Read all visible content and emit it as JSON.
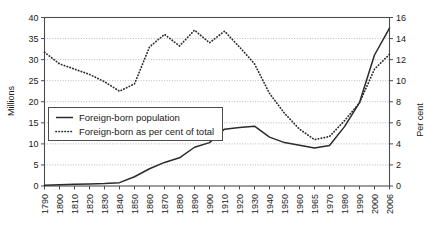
{
  "chart_data": {
    "type": "line",
    "title": "",
    "subtitle": "",
    "xlabel": "",
    "ylabel": "Millions",
    "y2label": "Per cent",
    "ylim": [
      0,
      40
    ],
    "y2lim": [
      0,
      16
    ],
    "ytick_labels": [
      "0",
      "5",
      "10",
      "15",
      "20",
      "25",
      "30",
      "35",
      "40"
    ],
    "ytick_values": [
      0,
      5,
      10,
      15,
      20,
      25,
      30,
      35,
      40
    ],
    "y2tick_labels": [
      "0",
      "2",
      "4",
      "6",
      "8",
      "10",
      "12",
      "14",
      "16"
    ],
    "y2tick_values": [
      0,
      2,
      4,
      6,
      8,
      10,
      12,
      14,
      16
    ],
    "grid": true,
    "grid_axis": "y",
    "legend_position": "inside-left",
    "categories": [
      "1790",
      "1800",
      "1810",
      "1820",
      "1830",
      "1840",
      "1850",
      "1860",
      "1870",
      "1880",
      "1890",
      "1900",
      "1910",
      "1920",
      "1930",
      "1940",
      "1950",
      "1960",
      "1965",
      "1970",
      "1980",
      "1990",
      "2000",
      "2006"
    ],
    "series": [
      {
        "name": "Foreign-born population",
        "style": "solid",
        "axis": "left",
        "unit": "millions",
        "values": [
          0.2,
          0.3,
          0.4,
          0.5,
          0.6,
          0.8,
          2.2,
          4.1,
          5.6,
          6.7,
          9.2,
          10.3,
          13.5,
          13.9,
          14.2,
          11.6,
          10.3,
          9.7,
          9.0,
          9.6,
          14.1,
          19.8,
          31.1,
          37.5
        ]
      },
      {
        "name": "Foreign-born as per cent of total",
        "style": "dotted",
        "axis": "right",
        "unit": "per cent",
        "values": [
          12.7,
          11.6,
          11.1,
          10.6,
          9.9,
          9.0,
          9.7,
          13.2,
          14.4,
          13.3,
          14.8,
          13.6,
          14.7,
          13.2,
          11.6,
          8.8,
          6.9,
          5.4,
          4.4,
          4.7,
          6.2,
          7.9,
          11.1,
          12.5
        ]
      }
    ]
  },
  "legend": {
    "entries": [
      {
        "label": "Foreign-born population",
        "style": "solid"
      },
      {
        "label": "Foreign-born as per cent of total",
        "style": "dotted"
      }
    ]
  },
  "axes": {
    "left_title": "Millions",
    "right_title": "Per cent"
  }
}
